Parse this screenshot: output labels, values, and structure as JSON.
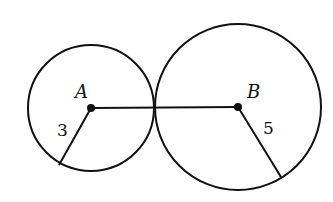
{
  "diagram": {
    "circles": [
      {
        "label": "A",
        "cx": 91,
        "cy": 108,
        "r": 62,
        "radius_label": "3"
      },
      {
        "label": "B",
        "cx": 238,
        "cy": 107,
        "r": 83,
        "radius_label": "5"
      }
    ],
    "segment": {
      "from": "A",
      "to": "B"
    },
    "colors": {
      "stroke": "#111111",
      "background": "#ffffff"
    }
  }
}
